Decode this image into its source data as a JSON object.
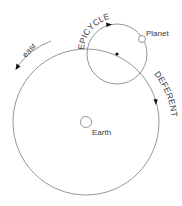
{
  "diagram": {
    "type": "ptolemaic-epicycle-model",
    "labels": {
      "epicycle": "EPICYCLE",
      "deferent": "DEFERENT",
      "planet": "Planet",
      "earth": "Earth",
      "direction": "east"
    },
    "colors": {
      "line": "#8a8a8a",
      "text": "#3a3a3a",
      "marker": "#111111",
      "background": "#ffffff"
    },
    "shapes": {
      "deferent_circle": {
        "cx": 86,
        "cy": 122,
        "r": 73
      },
      "epicycle_circle": {
        "cx": 117,
        "cy": 54,
        "r": 30
      },
      "epicycle_center_dot": {
        "cx": 117,
        "cy": 54
      },
      "planet_circle": {
        "cx": 142,
        "cy": 39,
        "r": 3.5
      },
      "earth_circle": {
        "cx": 86,
        "cy": 122,
        "r": 5.5
      }
    }
  }
}
